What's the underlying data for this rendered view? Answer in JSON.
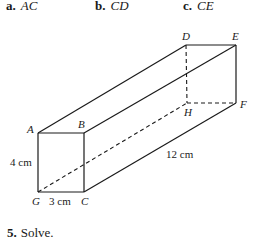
{
  "options": [
    {
      "letter": "a.",
      "segment": "AC"
    },
    {
      "letter": "b.",
      "segment": "CD"
    },
    {
      "letter": "c.",
      "segment": "CE"
    }
  ],
  "figure": {
    "vertices": {
      "A": "A",
      "B": "B",
      "C": "C",
      "D": "D",
      "E": "E",
      "F": "F",
      "G": "G",
      "H": "H"
    },
    "dimensions": {
      "height": "4 cm",
      "width": "3 cm",
      "length": "12 cm"
    }
  },
  "next_problem": {
    "number": "5.",
    "text": "Solve."
  }
}
